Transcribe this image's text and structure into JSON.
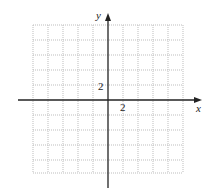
{
  "diagram": {
    "type": "coordinate-grid",
    "x_axis_label": "x",
    "y_axis_label": "y",
    "x_tick_label": "2",
    "y_tick_label": "2",
    "grid": {
      "columns": 10,
      "rows": 10,
      "units_per_cell": 1,
      "line_style": "dotted",
      "line_color": "#b8b8b8"
    },
    "axis_color": "#222222"
  }
}
